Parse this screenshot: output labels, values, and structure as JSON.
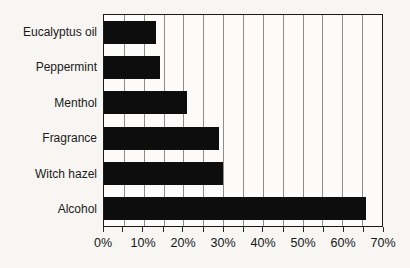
{
  "chart_data": {
    "type": "bar",
    "orientation": "horizontal",
    "title": "",
    "xlabel": "",
    "ylabel": "",
    "categories": [
      "Eucalyptus oil",
      "Peppermint",
      "Menthol",
      "Fragrance",
      "Witch hazel",
      "Alcohol"
    ],
    "values": [
      13,
      14,
      21,
      29,
      30,
      66
    ],
    "value_unit": "%",
    "xlim": [
      0,
      70
    ],
    "x_major_tick_step": 10,
    "x_minor_tick_step": 5,
    "x_tick_labels": [
      "0%",
      "10%",
      "20%",
      "30%",
      "40%",
      "50%",
      "60%",
      "70%"
    ],
    "grid": "vertical gridlines every 5%",
    "legend": "none",
    "bar_color": "#0d0d0d",
    "gridline_color": "#8f8d8a",
    "border_color": "#1a1a1a",
    "background_color": "#f7f6f3"
  }
}
